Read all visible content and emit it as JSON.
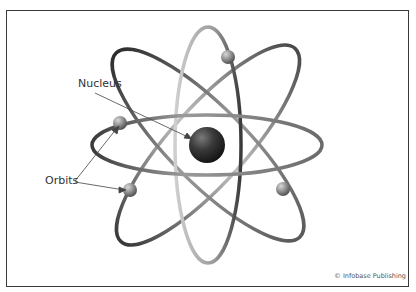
{
  "figure": {
    "labels": {
      "nucleus": "Nucleus",
      "orbits": "Orbits"
    },
    "credit": "© Infobase Publishing",
    "colors": {
      "border": "#3a3a3a",
      "orbit_dark": "#3c3c3c",
      "orbit_mid": "#8a8a8a",
      "orbit_light": "#c8c8c8",
      "nucleus": "#2e2e2e",
      "electron": "#8c8c8c"
    },
    "nucleus": {
      "cx": 207,
      "cy": 145,
      "r": 18
    },
    "orbits": [
      {
        "name": "horizontal-orbit",
        "cx": 207,
        "cy": 145,
        "rx": 115,
        "ry": 30,
        "rotate": 0
      },
      {
        "name": "vertical-orbit",
        "cx": 208,
        "cy": 145,
        "rx": 33,
        "ry": 118,
        "rotate": 0
      },
      {
        "name": "diagonal-orbit-1",
        "cx": 208,
        "cy": 145,
        "rx": 130,
        "ry": 38,
        "rotate": 45
      },
      {
        "name": "diagonal-orbit-2",
        "cx": 208,
        "cy": 145,
        "rx": 130,
        "ry": 38,
        "rotate": -45
      }
    ],
    "electrons": [
      {
        "cx": 228,
        "cy": 57
      },
      {
        "cx": 120,
        "cy": 123
      },
      {
        "cx": 130,
        "cy": 190
      },
      {
        "cx": 283,
        "cy": 189
      }
    ]
  }
}
